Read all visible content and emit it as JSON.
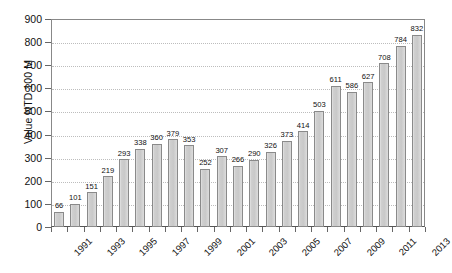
{
  "chart_data": {
    "type": "bar",
    "title": "",
    "xlabel": "",
    "ylabel": "Value NTD 100 M",
    "ylim": [
      0,
      900
    ],
    "ytick_step": 100,
    "yticks": [
      0,
      100,
      200,
      300,
      400,
      500,
      600,
      700,
      800,
      900
    ],
    "grid": true,
    "legend": "none",
    "xtick_labels_shown_every": 2,
    "categories": [
      "1991",
      "1992",
      "1993",
      "1994",
      "1995",
      "1996",
      "1997",
      "1998",
      "1999",
      "2000",
      "2001",
      "2002",
      "2003",
      "2004",
      "2005",
      "2006",
      "2007",
      "2008",
      "2009",
      "2010",
      "2011",
      "2012",
      "2013"
    ],
    "xtick_labels": [
      "1991",
      "",
      "1993",
      "",
      "1995",
      "",
      "1997",
      "",
      "1999",
      "",
      "2001",
      "",
      "2003",
      "",
      "2005",
      "",
      "2007",
      "",
      "2009",
      "",
      "2011",
      "",
      "2013"
    ],
    "values": [
      66,
      101,
      151,
      219,
      293,
      338,
      360,
      379,
      353,
      252,
      307,
      266,
      290,
      326,
      373,
      414,
      503,
      611,
      586,
      627,
      708,
      784,
      832
    ],
    "data_labels": [
      "66",
      "101",
      "151",
      "219",
      "293",
      "338",
      "360",
      "379",
      "353",
      "252",
      "307",
      "266",
      "290",
      "326",
      "373",
      "414",
      "503",
      "611",
      "586",
      "627",
      "708",
      "784",
      "832"
    ],
    "colors": {
      "bar_fill": "#cfcfcf",
      "bar_border": "#8a8a8a",
      "gridline": "#bdbdbd",
      "axis": "#666666",
      "text": "#111111",
      "background": "#ffffff"
    }
  }
}
